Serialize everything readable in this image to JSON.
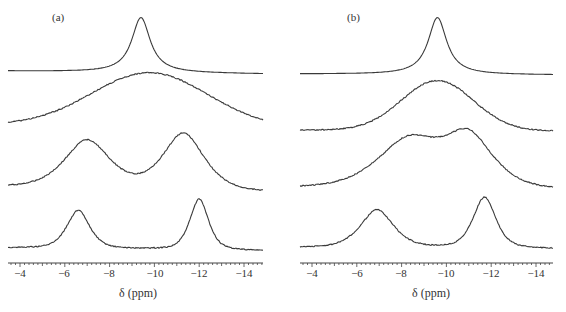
{
  "chart_data": [
    {
      "type": "line",
      "title": "(a)",
      "xlabel": "δ (ppm)",
      "ylabel": "",
      "xlim": [
        -3.5,
        -14.9
      ],
      "x_ticks": [
        -4,
        -6,
        -8,
        -10,
        -12,
        -14
      ],
      "x_tick_labels": [
        "−4",
        "−6",
        "−8",
        "−10",
        "−12",
        "−14"
      ],
      "grid": false,
      "legend": "none",
      "layout": "stacked spectra, top to bottom",
      "series": [
        {
          "name": "trace-1",
          "shape": "single sharp Lorentzian",
          "peaks": [
            {
              "position": -9.4,
              "relative_height": 1.0,
              "fwhm_ppm": 1.0
            }
          ]
        },
        {
          "name": "trace-2",
          "shape": "single very broad peak",
          "peaks": [
            {
              "position": -9.8,
              "relative_height": 1.0,
              "fwhm_ppm": 6.5
            }
          ]
        },
        {
          "name": "trace-3",
          "shape": "two broad overlapping peaks",
          "peaks": [
            {
              "position": -7.0,
              "relative_height": 0.85
            },
            {
              "position": -11.3,
              "relative_height": 1.0
            }
          ]
        },
        {
          "name": "trace-4",
          "shape": "two resolved peaks",
          "peaks": [
            {
              "position": -6.6,
              "relative_height": 0.75
            },
            {
              "position": -12.0,
              "relative_height": 1.0
            }
          ]
        }
      ]
    },
    {
      "type": "line",
      "title": "(b)",
      "xlabel": "δ (ppm)",
      "ylabel": "",
      "xlim": [
        -3.5,
        -14.9
      ],
      "x_ticks": [
        -4,
        -6,
        -8,
        -10,
        -12,
        -14
      ],
      "x_tick_labels": [
        "−4",
        "−6",
        "−8",
        "−10",
        "−12",
        "−14"
      ],
      "grid": false,
      "legend": "none",
      "layout": "stacked spectra, top to bottom",
      "series": [
        {
          "name": "trace-1",
          "shape": "single sharp Lorentzian",
          "peaks": [
            {
              "position": -9.6,
              "relative_height": 1.0,
              "fwhm_ppm": 1.0
            }
          ]
        },
        {
          "name": "trace-2",
          "shape": "single broad peak",
          "peaks": [
            {
              "position": -9.6,
              "relative_height": 1.0,
              "fwhm_ppm": 4.5
            }
          ]
        },
        {
          "name": "trace-3",
          "shape": "broad flat-topped band",
          "peaks": [
            {
              "position": -8.3,
              "relative_height": 0.95
            },
            {
              "position": -11.0,
              "relative_height": 1.0
            }
          ]
        },
        {
          "name": "trace-4",
          "shape": "two resolved peaks",
          "peaks": [
            {
              "position": -6.9,
              "relative_height": 0.75
            },
            {
              "position": -11.7,
              "relative_height": 1.0
            }
          ]
        }
      ]
    }
  ],
  "panels": [
    {
      "label": "(a)",
      "xlabel": "δ (ppm)",
      "ticks": [
        "−4",
        "−6",
        "−8",
        "−10",
        "−12",
        "−14"
      ]
    },
    {
      "label": "(b)",
      "xlabel": "δ (ppm)",
      "ticks": [
        "−4",
        "−6",
        "−8",
        "−10",
        "−12",
        "−14"
      ]
    }
  ],
  "colors": {
    "trace": "#3a3a3a",
    "axis": "#444444"
  }
}
